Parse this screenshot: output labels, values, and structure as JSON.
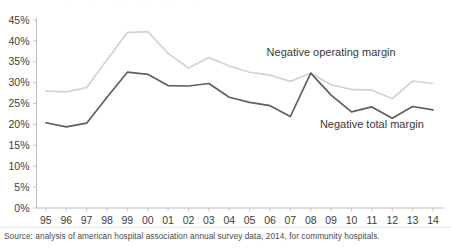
{
  "chart_data": {
    "type": "line",
    "title": "",
    "subtitle": "",
    "xlabel": "",
    "ylabel": "",
    "categories": [
      "95",
      "96",
      "97",
      "98",
      "99",
      "00",
      "01",
      "02",
      "03",
      "04",
      "05",
      "06",
      "07",
      "08",
      "09",
      "10",
      "11",
      "12",
      "13",
      "14"
    ],
    "ylim": [
      0,
      45
    ],
    "ytick_labels": [
      "0%",
      "5%",
      "10%",
      "15%",
      "20%",
      "25%",
      "30%",
      "35%",
      "40%",
      "45%"
    ],
    "ytick_values": [
      0,
      5,
      10,
      15,
      20,
      25,
      30,
      35,
      40,
      45
    ],
    "grid": false,
    "legend_position": "inline-annotations",
    "series": [
      {
        "name": "Negative operating margin",
        "color": "#d3d3d3",
        "values": [
          28.0,
          27.8,
          28.8,
          35.5,
          42.0,
          42.2,
          37.0,
          33.5,
          36.0,
          34.0,
          32.5,
          31.8,
          30.3,
          32.3,
          29.5,
          28.4,
          28.2,
          26.2,
          30.4,
          29.8
        ]
      },
      {
        "name": "Negative total margin",
        "color": "#5f5f5f",
        "values": [
          20.4,
          19.4,
          20.3,
          26.5,
          32.5,
          32.0,
          29.3,
          29.2,
          29.8,
          26.5,
          25.3,
          24.5,
          21.9,
          32.3,
          27.0,
          23.0,
          24.2,
          21.5,
          24.3,
          23.5
        ]
      }
    ],
    "annotations": [
      {
        "text": "Negative operating margin",
        "x_category": "09",
        "value": 36.5
      },
      {
        "text": "Negative total margin",
        "x_category": "11",
        "value": 19.2
      }
    ]
  },
  "footer": {
    "source": "Source: analysis of american hospital association annual survey data, 2014, for community hospitals."
  },
  "axis": {
    "axis_color": "#bdbdbd",
    "tick_color": "#c8c8c8",
    "label_color": "#3d3d3d"
  }
}
